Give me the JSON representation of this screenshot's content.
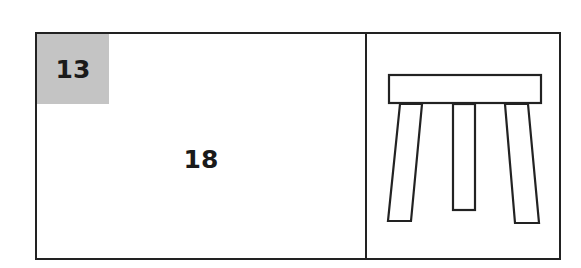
{
  "card": {
    "number": "13",
    "value": "18",
    "picture": "stool-icon",
    "colors": {
      "badge_background": "#c4c4c4",
      "border": "#222222",
      "text": "#1a1a1a"
    }
  }
}
